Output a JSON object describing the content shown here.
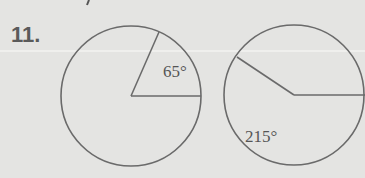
{
  "problem": {
    "number": "11."
  },
  "figures": [
    {
      "label": "65°",
      "angle": 65,
      "center": [
        131,
        96
      ],
      "radius": 70
    },
    {
      "label": "215°",
      "angle": 215,
      "center": [
        294,
        95
      ],
      "radius": 70
    }
  ],
  "colors": {
    "background": "#e4e4e2",
    "stroke": "#6a6a6a",
    "text": "#555555"
  }
}
